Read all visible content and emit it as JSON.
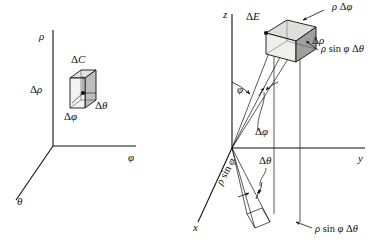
{
  "figure": {
    "type": "math-diagram",
    "colors": {
      "line": "#111111",
      "box_light": "#e8e8e8",
      "box_mid": "#c9c9c9",
      "box_dark": "#9a9a9a",
      "background": "#ffffff"
    }
  },
  "left_diagram": {
    "name": "rho-phi-theta-box-diagram",
    "axes": [
      {
        "id": "rho",
        "label": "ρ"
      },
      {
        "id": "phi",
        "label": "φ"
      },
      {
        "id": "theta",
        "label": "θ"
      }
    ],
    "labels": {
      "box": {
        "delta": "Δ",
        "var": "C"
      },
      "height": {
        "delta": "Δ",
        "var": "ρ"
      },
      "depth": {
        "delta": "Δ",
        "var": "φ"
      },
      "width": {
        "delta": "Δ",
        "var": "θ"
      }
    }
  },
  "right_diagram": {
    "name": "spherical-volume-element-diagram",
    "axes": [
      {
        "id": "z",
        "label": "z"
      },
      {
        "id": "y",
        "label": "y"
      },
      {
        "id": "x",
        "label": "x"
      }
    ],
    "labels": {
      "solid": {
        "delta": "Δ",
        "var": "E"
      },
      "top_edge": {
        "expr_rho": "ρ",
        "delta": "Δ",
        "var": "φ"
      },
      "side_edge": {
        "delta": "Δ",
        "var": "ρ"
      },
      "front_edge": {
        "expr_rho": "ρ",
        "fn": "sin",
        "angle": "φ",
        "delta": "Δ",
        "var": "θ"
      },
      "polar_angle": {
        "var": "φ"
      },
      "delta_phi": {
        "delta": "Δ",
        "var": "φ"
      },
      "delta_theta": {
        "delta": "Δ",
        "var": "θ"
      },
      "rho_sin_phi": {
        "expr_rho": "ρ",
        "fn": "sin",
        "angle": "φ"
      },
      "base_arc": {
        "expr_rho": "ρ",
        "fn": "sin",
        "angle": "φ",
        "delta": "Δ",
        "var": "θ"
      }
    }
  }
}
